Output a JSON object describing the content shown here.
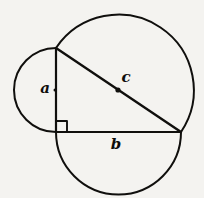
{
  "figure": {
    "background_color": "#f4f3f0",
    "ink_color": "#100f0d",
    "width": 204,
    "height": 198
  },
  "labels": {
    "leg_a": "a",
    "leg_b": "b",
    "hypotenuse_c": "c"
  },
  "geometry": {
    "vertices": {
      "top": {
        "x": 56,
        "y": 48
      },
      "right_angle": {
        "x": 56,
        "y": 132
      },
      "right": {
        "x": 181,
        "y": 132
      }
    },
    "circles": [
      {
        "name": "circle-on-hypotenuse-c",
        "cx": 118,
        "cy": 90,
        "r": 75
      },
      {
        "name": "circle-on-leg-a",
        "cx": 56,
        "cy": 90,
        "r": 42
      },
      {
        "name": "circle-on-leg-b",
        "cx": 118,
        "cy": 132,
        "r": 62
      }
    ],
    "right_angle_marker": {
      "x": 56,
      "y": 132,
      "size": 11
    },
    "hypotenuse_midpoint_dot": {
      "cx": 118,
      "cy": 90,
      "r": 2.6
    }
  },
  "label_positions": {
    "a": {
      "x": 45,
      "y": 88,
      "dot_x": 55,
      "dot_y": 90
    },
    "b": {
      "x": 116,
      "y": 144
    },
    "c": {
      "x": 126,
      "y": 78
    }
  }
}
